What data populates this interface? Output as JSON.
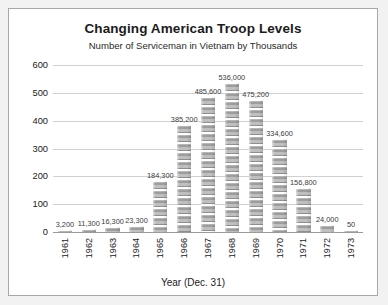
{
  "chart_data": {
    "type": "bar",
    "title": "Changing American Troop Levels",
    "subtitle": "Number of Serviceman in Vietnam by Thousands",
    "xlabel": "Year (Dec. 31)",
    "ylabel": "",
    "ylim": [
      0,
      600
    ],
    "yticks": [
      "0",
      "100",
      "200",
      "300",
      "400",
      "500",
      "600"
    ],
    "ytick_values": [
      0,
      100,
      200,
      300,
      400,
      500,
      600
    ],
    "grid": true,
    "legend": "none",
    "units": "thousands",
    "categories": [
      "1961",
      "1962",
      "1963",
      "1964",
      "1965",
      "1966",
      "1967",
      "1968",
      "1969",
      "1970",
      "1971",
      "1972",
      "1973"
    ],
    "values": [
      3.2,
      11.3,
      16.3,
      23.3,
      184.3,
      385.2,
      485.6,
      536.0,
      475.2,
      334.6,
      156.8,
      24.0,
      0.05
    ],
    "data_labels": [
      "3,200",
      "11,300",
      "16,300",
      "23,300",
      "184,300",
      "385,200",
      "485,600",
      "536,000",
      "475,200",
      "334,600",
      "156,800",
      "24,000",
      "50"
    ],
    "bar_style": "pictograph-soldier-stack",
    "bar_color": "#a5a5a5"
  },
  "colors": {
    "page_background": "#f2f2f2",
    "panel_background": "#ffffff",
    "panel_border": "#a8a8a8",
    "gridline": "#d0d0d0",
    "axis": "#9a9a9a",
    "text": "#1b1b1b",
    "label_text": "#3a3a3a"
  }
}
